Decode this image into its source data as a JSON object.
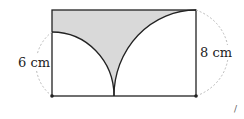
{
  "figure": {
    "labels": {
      "left": "6 cm",
      "right": "8 cm"
    },
    "mark": "/",
    "colors": {
      "stroke": "#222222",
      "shade": "#d9d9d9",
      "dash": "#bbbbbb"
    }
  }
}
